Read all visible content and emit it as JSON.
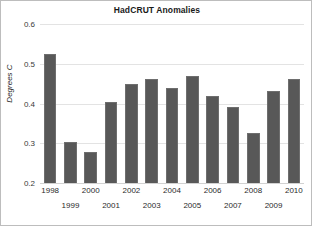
{
  "chart_data": {
    "type": "bar",
    "title": "HadCRUT Anomalies",
    "xlabel": "",
    "ylabel": "Degrees C",
    "categories": [
      "1998",
      "1999",
      "2000",
      "2001",
      "2002",
      "2003",
      "2004",
      "2005",
      "2006",
      "2007",
      "2008",
      "2009",
      "2010"
    ],
    "values": [
      0.525,
      0.302,
      0.277,
      0.405,
      0.45,
      0.462,
      0.44,
      0.47,
      0.42,
      0.392,
      0.325,
      0.432,
      0.462
    ],
    "ylim": [
      0.2,
      0.6
    ],
    "yticks": [
      "0.2",
      "0.3",
      "0.4",
      "0.5",
      "0.6"
    ],
    "ytick_values": [
      0.2,
      0.3,
      0.4,
      0.5,
      0.6
    ],
    "grid": true,
    "legend": false,
    "bar_color": "#585858",
    "bar_edge_color": "#6e6e6e",
    "grid_color": "#e3e3e3",
    "frame_color": "#bdbdbd"
  }
}
